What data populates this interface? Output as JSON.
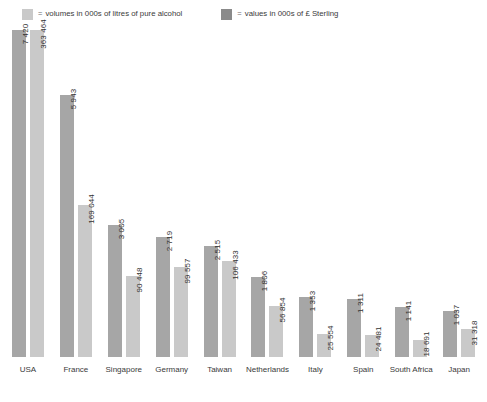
{
  "legend": {
    "equals_glyph": "=",
    "entries": [
      {
        "icon": "legend-swatch-volumes",
        "label": "volumes in 000s of litres of pure alcohol",
        "color": "#c9c9c9"
      },
      {
        "icon": "legend-swatch-values",
        "label": "values in 000s of £ Sterling",
        "color": "#8a8a8a"
      }
    ]
  },
  "chart_data": {
    "type": "bar",
    "title": "",
    "subtitle": "",
    "xlabel": "",
    "ylabel": "",
    "grid": false,
    "legend_position": "top-left",
    "axis_note": "two independent value scales, one per series; no numeric y-axis shown",
    "categories": [
      "USA",
      "France",
      "Singapore",
      "Germany",
      "Taiwan",
      "Netherlands",
      "Italy",
      "Spain",
      "South Africa",
      "Japan"
    ],
    "series": [
      {
        "name": "volumes in 000s of litres of pure alcohol",
        "color": "#a6a6a6",
        "values": [
          7420,
          5943,
          3005,
          2719,
          2515,
          1806,
          1353,
          1311,
          1141,
          1037
        ],
        "labels": [
          "7 420",
          "5 943",
          "3 005",
          "2 719",
          "2 515",
          "1 806",
          "1 353",
          "1 311",
          "1 141",
          "1 037"
        ]
      },
      {
        "name": "values in 000s of £ Sterling",
        "color": "#c9c9c9",
        "values": [
          363464,
          169044,
          90448,
          99557,
          106433,
          56854,
          25554,
          24481,
          18691,
          31318
        ],
        "labels": [
          "363 464",
          "169 044",
          "90 448",
          "99 557",
          "106 433",
          "56 854",
          "25 554",
          "24 481",
          "18 691",
          "31 318"
        ]
      }
    ]
  }
}
